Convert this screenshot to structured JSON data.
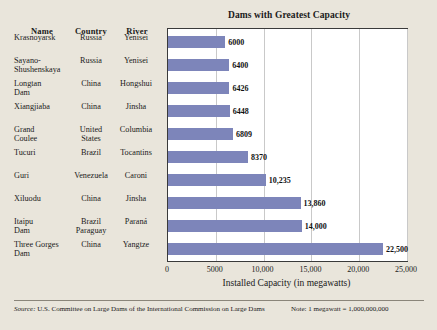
{
  "chart_data": {
    "type": "bar",
    "orientation": "horizontal",
    "title": "Dams with Greatest Capacity",
    "xlabel": "Installed Capacity (in megawatts)",
    "ylabel": "",
    "xlim": [
      0,
      25000
    ],
    "xticks": [
      "0",
      "5000",
      "10,000",
      "15,000",
      "20,000",
      "25,000"
    ],
    "xtick_values": [
      0,
      5000,
      10000,
      15000,
      20000,
      25000
    ],
    "grid": "vertical",
    "legend": "none",
    "categories": [
      "Krasnoyarsk",
      "Sayano-Shushenskaya",
      "Longtan Dam",
      "Xiangjiaba",
      "Grand Coulee",
      "Tucuri",
      "Guri",
      "Xiluodu",
      "Itaipu Dam",
      "Three Gorges Dam"
    ],
    "values": [
      6000,
      6400,
      6426,
      6448,
      6809,
      8370,
      10235,
      13860,
      14000,
      22500
    ],
    "value_labels": [
      "6000",
      "6400",
      "6426",
      "6448",
      "6809",
      "8370",
      "10,235",
      "13,860",
      "14,000",
      "22,500"
    ],
    "bar_color": "#7d85ba"
  },
  "table": {
    "headers": [
      "Name",
      "Country",
      "River"
    ],
    "rows": [
      {
        "name": "Krasnoyarsk",
        "country": "Russia",
        "river": "Yenisei"
      },
      {
        "name": "Sayano-\nShushenskaya",
        "country": "Russia",
        "river": "Yenisei"
      },
      {
        "name": "Longtan\nDam",
        "country": "China",
        "river": "Hongshui"
      },
      {
        "name": "Xiangjiaba",
        "country": "China",
        "river": "Jinsha"
      },
      {
        "name": "Grand\nCoulee",
        "country": "United\nStates",
        "river": "Columbia"
      },
      {
        "name": "Tucuri",
        "country": "Brazil",
        "river": "Tocantins"
      },
      {
        "name": "Guri",
        "country": "Venezuela",
        "river": "Caroni"
      },
      {
        "name": "Xiluodu",
        "country": "China",
        "river": "Jinsha"
      },
      {
        "name": "Itaipu\nDam",
        "country": "Brazil\nParaguay",
        "river": "Paraná"
      },
      {
        "name": "Three Gorges\nDam",
        "country": "China",
        "river": "Yangtze"
      }
    ]
  },
  "footer": {
    "source_prefix": "Source:",
    "source_body": " U.S. Committee on Large Dams of the International Commission on Large Dams",
    "note": "Note: 1 megawatt = 1,000,000,000"
  }
}
